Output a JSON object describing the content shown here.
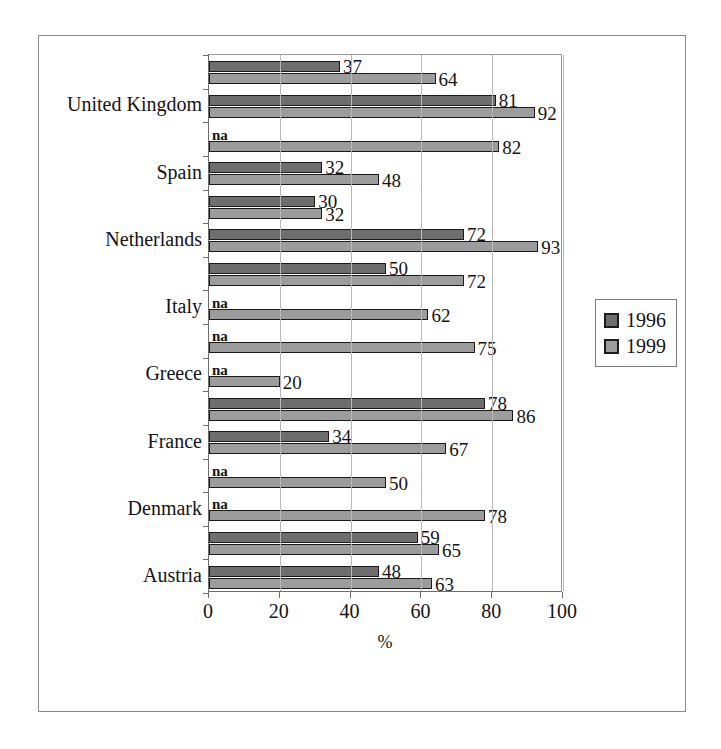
{
  "chart_data": {
    "type": "bar",
    "orientation": "horizontal",
    "title": "",
    "xlabel": "%",
    "ylabel": "",
    "xlim": [
      0,
      100
    ],
    "xticks": [
      0,
      20,
      40,
      60,
      80,
      100
    ],
    "grid": true,
    "legend_position": "right",
    "series": [
      {
        "name": "1996",
        "color": "#6e6e6e"
      },
      {
        "name": "1999",
        "color": "#9c9c9c"
      }
    ],
    "categories": [
      "United Kingdom",
      "",
      "Spain",
      "",
      "Netherlands",
      "",
      "Italy",
      "",
      "Greece",
      "",
      "France",
      "",
      "Denmark",
      "",
      "Austria"
    ],
    "rows": [
      {
        "label": "",
        "v1996": 37,
        "v1999": 64,
        "l1996": "37",
        "l1999": "64"
      },
      {
        "label": "United Kingdom",
        "v1996": 81,
        "v1999": 92,
        "l1996": "81",
        "l1999": "92"
      },
      {
        "label": "",
        "v1996": null,
        "v1999": 82,
        "l1996": "na",
        "l1999": "82"
      },
      {
        "label": "Spain",
        "v1996": 32,
        "v1999": 48,
        "l1996": "32",
        "l1999": "48"
      },
      {
        "label": "",
        "v1996": 30,
        "v1999": 32,
        "l1996": "30",
        "l1999": "32"
      },
      {
        "label": "Netherlands",
        "v1996": 72,
        "v1999": 93,
        "l1996": "72",
        "l1999": "93"
      },
      {
        "label": "",
        "v1996": 50,
        "v1999": 72,
        "l1996": "50",
        "l1999": "72"
      },
      {
        "label": "Italy",
        "v1996": null,
        "v1999": 62,
        "l1996": "na",
        "l1999": "62"
      },
      {
        "label": "",
        "v1996": null,
        "v1999": 75,
        "l1996": "na",
        "l1999": "75"
      },
      {
        "label": "Greece",
        "v1996": null,
        "v1999": 20,
        "l1996": "na",
        "l1999": "20"
      },
      {
        "label": "",
        "v1996": 78,
        "v1999": 86,
        "l1996": "78",
        "l1999": "86"
      },
      {
        "label": "France",
        "v1996": 34,
        "v1999": 67,
        "l1996": "34",
        "l1999": "67"
      },
      {
        "label": "",
        "v1996": null,
        "v1999": 50,
        "l1996": "na",
        "l1999": "50"
      },
      {
        "label": "Denmark",
        "v1996": null,
        "v1999": 78,
        "l1996": "na",
        "l1999": "78"
      },
      {
        "label": "",
        "v1996": 59,
        "v1999": 65,
        "l1996": "59",
        "l1999": "65"
      },
      {
        "label": "Austria",
        "v1996": 48,
        "v1999": 63,
        "l1996": "48",
        "l1999": "63"
      }
    ]
  },
  "legend": {
    "items": [
      {
        "label": "1996",
        "color": "#6e6e6e"
      },
      {
        "label": "1999",
        "color": "#9c9c9c"
      }
    ]
  },
  "axis": {
    "x_title": "%",
    "x_tick_labels": [
      "0",
      "20",
      "40",
      "60",
      "80",
      "100"
    ]
  }
}
